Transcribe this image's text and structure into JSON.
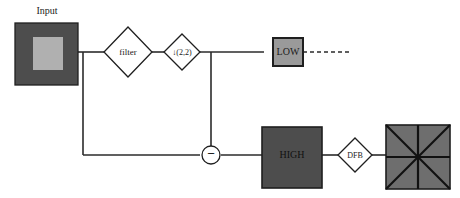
{
  "diagram": {
    "colors": {
      "background": "#ffffff",
      "wire": "#2b2b2b",
      "outline": "#1f1f1f",
      "dark_block_fill": "#4d4d4d",
      "inner_block_fill": "#b0b0b0",
      "low_box_fill": "#9a9a9a",
      "wedge_fill": "#6e6e6e",
      "wedge_line": "#111111",
      "text": "#1a1a1a"
    },
    "nodes": {
      "input_label": "Input",
      "filter_label": "filter",
      "downsample_label": "↓(2,2)",
      "low_label": "LOW",
      "high_label": "HIGH",
      "dfb_label": "DFB",
      "subtract_label": "−"
    }
  }
}
